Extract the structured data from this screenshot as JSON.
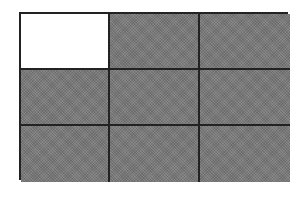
{
  "diagram": {
    "type": "grid",
    "rows": 3,
    "columns": 3,
    "colors": {
      "filled": "#7a7a7a",
      "empty": "#ffffff",
      "line": "#222222"
    },
    "cells": [
      [
        "empty",
        "filled",
        "filled"
      ],
      [
        "filled",
        "filled",
        "filled"
      ],
      [
        "filled",
        "filled",
        "filled"
      ]
    ]
  }
}
